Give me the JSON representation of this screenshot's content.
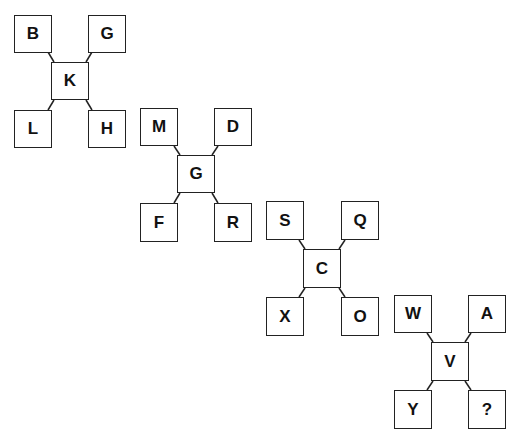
{
  "puzzle": {
    "clusters": [
      {
        "center": "K",
        "top_left": "B",
        "top_right": "G",
        "bottom_left": "L",
        "bottom_right": "H"
      },
      {
        "center": "G",
        "top_left": "M",
        "top_right": "D",
        "bottom_left": "F",
        "bottom_right": "R"
      },
      {
        "center": "C",
        "top_left": "S",
        "top_right": "Q",
        "bottom_left": "X",
        "bottom_right": "O"
      },
      {
        "center": "V",
        "top_left": "W",
        "top_right": "A",
        "bottom_left": "Y",
        "bottom_right": "?"
      }
    ]
  }
}
